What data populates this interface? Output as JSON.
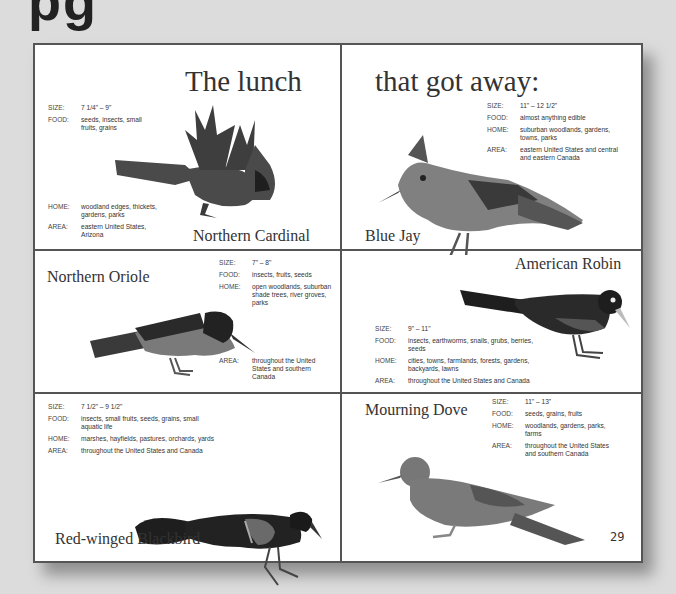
{
  "page_heading_fragment": "pg",
  "title_left": "The lunch",
  "title_right": "that got away:",
  "page_number": "29",
  "labels": {
    "size": "SIZE:",
    "food": "FOOD:",
    "home": "HOME:",
    "area": "AREA:"
  },
  "birds": [
    {
      "name": "Northern Cardinal",
      "size": "7 1/4\" – 9\"",
      "food": "seeds, insects, small fruits, grains",
      "home": "woodland edges, thickets, gardens, parks",
      "area": "eastern United States, Arizona",
      "color": "#b0302a"
    },
    {
      "name": "Blue Jay",
      "size": "11\" – 12 1/2\"",
      "food": "almost anything edible",
      "home": "suburban woodlands, gardens, towns, parks",
      "area": "eastern United States and central and eastern Canada",
      "color": "#4a78b8"
    },
    {
      "name": "Northern Oriole",
      "size": "7\" – 8\"",
      "food": "insects, fruits, seeds",
      "home": "open woodlands, suburban shade trees, river groves, parks",
      "area": "throughout the United States and southern Canada",
      "color": "#e07a20"
    },
    {
      "name": "American Robin",
      "size": "9\" – 11\"",
      "food": "insects, earthworms, snails, grubs, berries, seeds",
      "home": "cities, towns, farmlands, forests, gardens, backyards, lawns",
      "area": "throughout the United States and Canada",
      "color": "#3a3a3a"
    },
    {
      "name": "Red-winged Blackbird",
      "size": "7 1/2\" – 9 1/2\"",
      "food": "insects, small fruits, seeds, grains, small aquatic life",
      "home": "marshes, hayfields, pastures, orchards, yards",
      "area": "throughout the United States and Canada",
      "color": "#1e1e1e"
    },
    {
      "name": "Mourning Dove",
      "size": "11\" – 13\"",
      "food": "seeds, grains, fruits",
      "home": "woodlands, gardens, parks, farms",
      "area": "throughout the United States and southern Canada",
      "color": "#8a7f78"
    }
  ]
}
